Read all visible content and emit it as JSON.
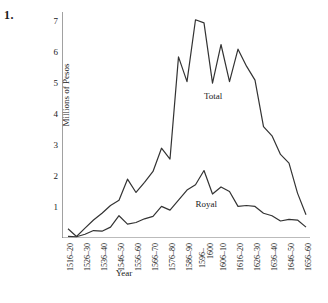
{
  "figure": {
    "number_label": "1."
  },
  "chart_data": {
    "type": "line",
    "title": "",
    "xlabel": "Year",
    "ylabel": "Millions of Pesos",
    "ylim": [
      0,
      7.3
    ],
    "yticks": [
      1,
      2,
      3,
      4,
      5,
      6,
      7
    ],
    "ytick_labels": [
      "1",
      "2",
      "3",
      "4",
      "5",
      "6",
      "7"
    ],
    "grid": false,
    "legend_position": "inline-annotations",
    "x_tick_labels": [
      "1516–20",
      "1526–30",
      "1536–40",
      "1546–50",
      "1556–60",
      "1566–70",
      "1576–80",
      "1586–90",
      "1596–",
      "1606–10",
      "1616–20",
      "1626–30",
      "1636–40",
      "1646–50",
      "1656–60"
    ],
    "x_tick_label_extra": "1600",
    "x_tick_label_extra_index": 8,
    "x": [
      "1516–20",
      "1521–25",
      "1526–30",
      "1531–35",
      "1536–40",
      "1541–45",
      "1546–50",
      "1551–55",
      "1556–60",
      "1561–65",
      "1566–70",
      "1571–75",
      "1576–80",
      "1581–85",
      "1586–90",
      "1591–95",
      "1596–1600",
      "1601–05",
      "1606–10",
      "1611–15",
      "1616–20",
      "1621–25",
      "1626–30",
      "1631–35",
      "1636–40",
      "1641–45",
      "1646–50",
      "1651–55",
      "1656–60"
    ],
    "series": [
      {
        "name": "Total",
        "color": "#333333",
        "values": [
          0.3,
          0.05,
          0.32,
          0.58,
          0.8,
          1.05,
          1.22,
          1.9,
          1.47,
          1.8,
          2.15,
          2.9,
          2.55,
          5.85,
          5.05,
          7.05,
          6.95,
          5.0,
          6.25,
          5.05,
          6.1,
          5.55,
          5.1,
          3.6,
          3.3,
          2.7,
          2.42,
          1.45,
          0.75
        ]
      },
      {
        "name": "Royal",
        "color": "#333333",
        "values": [
          0.05,
          0.04,
          0.12,
          0.24,
          0.22,
          0.35,
          0.72,
          0.45,
          0.5,
          0.62,
          0.7,
          1.02,
          0.9,
          1.22,
          1.55,
          1.72,
          2.18,
          1.42,
          1.65,
          1.5,
          1.02,
          1.05,
          1.02,
          0.8,
          0.72,
          0.55,
          0.6,
          0.58,
          0.35
        ]
      }
    ],
    "annotations": [
      {
        "text": "Total",
        "x_index": 16,
        "y_value": 4.55
      },
      {
        "text": "Royal",
        "x_index": 15,
        "y_value": 1.05
      }
    ]
  }
}
